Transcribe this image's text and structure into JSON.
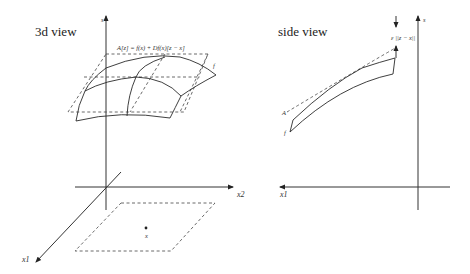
{
  "panels": {
    "left": {
      "title": "3d view",
      "axes": {
        "vertical": "s",
        "horizontal": "x2",
        "diagonal": "x1"
      },
      "tangent_label": "A[z] = f(x) + Df(x)[z − x]",
      "surface_label": "f",
      "point_label": "x"
    },
    "right": {
      "title": "side view",
      "axes": {
        "vertical": "s",
        "horizontal": "x1"
      },
      "gap_label": "ε ||z − x||",
      "tangent_label": "A",
      "surface_label": "f"
    }
  }
}
